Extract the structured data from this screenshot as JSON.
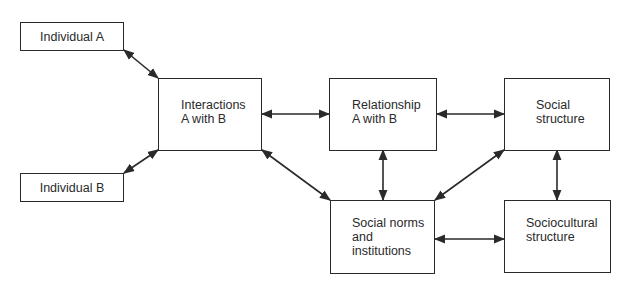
{
  "diagram": {
    "nodes": {
      "individual_a": {
        "label": "Individual A"
      },
      "individual_b": {
        "label": "Individual B"
      },
      "interactions": {
        "line1": "Interactions",
        "line2": "A with B"
      },
      "relationship": {
        "line1": "Relationship",
        "line2": "A with B"
      },
      "social_structure": {
        "line1": "Social",
        "line2": "structure"
      },
      "social_norms": {
        "line1": "Social norms",
        "line2": "and",
        "line3": "institutions"
      },
      "sociocultural": {
        "line1": "Sociocultural",
        "line2": "structure"
      }
    },
    "edges": [
      {
        "from": "Individual A",
        "to": "Interactions A with B",
        "direction": "both"
      },
      {
        "from": "Individual B",
        "to": "Interactions A with B",
        "direction": "both"
      },
      {
        "from": "Interactions A with B",
        "to": "Relationship A with B",
        "direction": "both"
      },
      {
        "from": "Relationship A with B",
        "to": "Social structure",
        "direction": "both"
      },
      {
        "from": "Interactions A with B",
        "to": "Social norms and institutions",
        "direction": "both"
      },
      {
        "from": "Relationship A with B",
        "to": "Social norms and institutions",
        "direction": "both"
      },
      {
        "from": "Social structure",
        "to": "Social norms and institutions",
        "direction": "both"
      },
      {
        "from": "Social structure",
        "to": "Sociocultural structure",
        "direction": "both"
      },
      {
        "from": "Social norms and institutions",
        "to": "Sociocultural structure",
        "direction": "both"
      }
    ],
    "colors": {
      "stroke": "#2a2a2a",
      "background": "#ffffff"
    }
  }
}
